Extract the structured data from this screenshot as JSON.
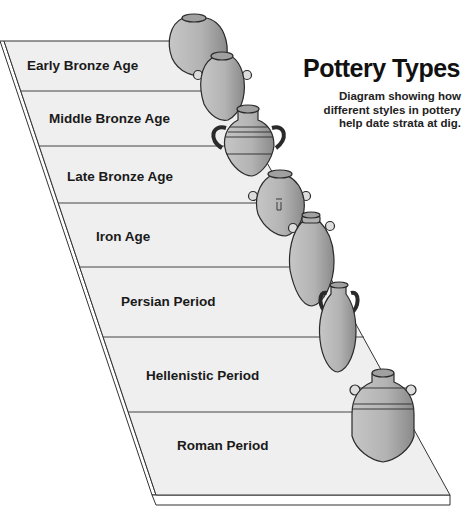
{
  "title": "Pottery Types",
  "subtitle": {
    "lines": [
      "Diagram showing how",
      "different styles in pottery",
      "help date strata at  dig."
    ]
  },
  "layers": [
    {
      "label": "Early Bronze Age"
    },
    {
      "label": "Middle Bronze Age"
    },
    {
      "label": "Late Bronze Age"
    },
    {
      "label": "Iron Age"
    },
    {
      "label": "Persian Period"
    },
    {
      "label": "Hellenistic Period"
    },
    {
      "label": "Roman Period"
    }
  ],
  "vessels": [
    {
      "period": "Early Bronze Age",
      "type": "round-jar-icon"
    },
    {
      "period": "Early Bronze Age",
      "type": "oval-two-handled-jar-icon"
    },
    {
      "period": "Middle Bronze Age",
      "type": "ribbed-handled-amphora-icon"
    },
    {
      "period": "Late Bronze Age",
      "type": "marked-oval-jar-icon"
    },
    {
      "period": "Iron Age",
      "type": "tall-handled-jar-icon"
    },
    {
      "period": "Persian Period",
      "type": "amphora-icon"
    },
    {
      "period": "Roman Period",
      "type": "ribbed-pointed-jar-icon"
    }
  ],
  "colors": {
    "slab_fill": "#efefef",
    "slab_edge": "#333333",
    "pottery_fill": "#b5b5b5",
    "pottery_shadow": "#8f8f8f",
    "outline": "#2a2a2a",
    "text": "#111111"
  }
}
